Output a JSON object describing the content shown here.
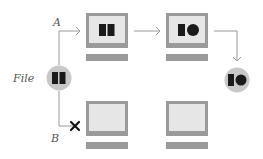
{
  "labels": {
    "file": "File",
    "path_a": "A",
    "path_b": "B"
  },
  "nodes": {
    "source": {
      "name": "file-source",
      "content": "two-blocks"
    },
    "a_step1": {
      "name": "monitor-a1",
      "content": "two-blocks"
    },
    "a_step2": {
      "name": "monitor-a2",
      "content": "block-and-circle"
    },
    "result": {
      "name": "file-result",
      "content": "block-and-circle"
    },
    "b_step1": {
      "name": "monitor-b1",
      "content": "empty"
    },
    "b_step2": {
      "name": "monitor-b2",
      "content": "empty"
    }
  },
  "edges": [
    {
      "from": "source",
      "to": "a_step1",
      "status": "ok"
    },
    {
      "from": "a_step1",
      "to": "a_step2",
      "status": "ok"
    },
    {
      "from": "a_step2",
      "to": "result",
      "status": "ok"
    },
    {
      "from": "source",
      "to": "b_step1",
      "status": "blocked"
    }
  ],
  "colors": {
    "frame": "#9a9a9a",
    "screen": "#e6e6e6",
    "circle": "#c8c8c8",
    "glyph": "#1a1a1a",
    "line": "#9a9a9a",
    "blocked": "#111111"
  }
}
